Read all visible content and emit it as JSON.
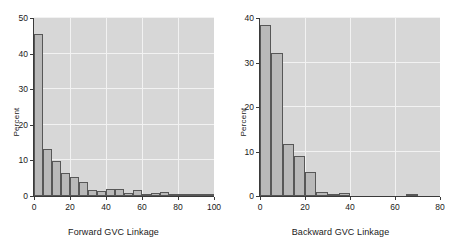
{
  "figure": {
    "background_color": "#ffffff",
    "plot_background_color": "#d7d7d7",
    "grid_color": "#f2f2f2",
    "bar_fill_color": "#b9b9b9",
    "bar_edge_color": "#575757",
    "axis_color": "#3a3a3a"
  },
  "chart_data": [
    {
      "type": "bar",
      "id": "forward-gvc-histogram",
      "title": "",
      "xlabel": "Forward GVC Linkage",
      "ylabel": "Percent",
      "xlim": [
        0,
        100
      ],
      "ylim": [
        0,
        50
      ],
      "xticks": [
        0,
        20,
        40,
        60,
        80,
        100
      ],
      "xticklabels": [
        "0",
        "20",
        "40",
        "60",
        "80",
        "100"
      ],
      "yticks": [
        0,
        10,
        20,
        30,
        40,
        50
      ],
      "yticklabels": [
        "0",
        "10",
        "20",
        "30",
        "40",
        "50"
      ],
      "grid": true,
      "legend": "none",
      "bin_width": 5,
      "bin_starts": [
        0,
        5,
        10,
        15,
        20,
        25,
        30,
        35,
        40,
        45,
        50,
        55,
        60,
        65,
        70,
        75,
        80,
        85,
        90,
        95
      ],
      "categories": [
        "0-5",
        "5-10",
        "10-15",
        "15-20",
        "20-25",
        "25-30",
        "30-35",
        "35-40",
        "40-45",
        "45-50",
        "50-55",
        "55-60",
        "60-65",
        "65-70",
        "70-75",
        "75-80",
        "80-85",
        "85-90",
        "90-95",
        "95-100"
      ],
      "values": [
        45.5,
        13.3,
        9.9,
        6.5,
        5.3,
        3.9,
        1.7,
        1.5,
        2.0,
        2.1,
        0.8,
        1.8,
        0.4,
        0.9,
        1.0,
        0.3,
        0.3,
        0.2,
        0.2,
        0.15
      ]
    },
    {
      "type": "bar",
      "id": "backward-gvc-histogram",
      "title": "",
      "xlabel": "Backward GVC Linkage",
      "ylabel": "Percent",
      "xlim": [
        0,
        80
      ],
      "ylim": [
        0,
        40
      ],
      "xticks": [
        0,
        20,
        40,
        60,
        80
      ],
      "xticklabels": [
        "0",
        "20",
        "40",
        "60",
        "80"
      ],
      "yticks": [
        0,
        10,
        20,
        30,
        40
      ],
      "yticklabels": [
        "0",
        "10",
        "20",
        "30",
        "40"
      ],
      "grid": true,
      "legend": "none",
      "bin_width": 5,
      "bin_starts": [
        0,
        5,
        10,
        15,
        20,
        25,
        30,
        35,
        65
      ],
      "categories": [
        "0-5",
        "5-10",
        "10-15",
        "15-20",
        "20-25",
        "25-30",
        "30-35",
        "35-40",
        "65-70"
      ],
      "values": [
        38.5,
        32.2,
        11.7,
        9.0,
        5.5,
        0.8,
        0.3,
        0.6,
        0.35
      ]
    }
  ]
}
